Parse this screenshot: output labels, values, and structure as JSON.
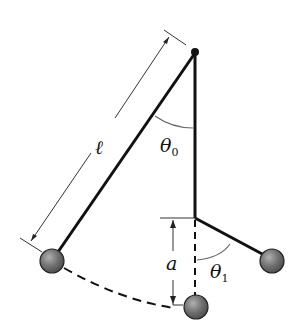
{
  "diagram": {
    "type": "pendulum-with-peg",
    "labels": {
      "length": "ℓ",
      "theta0_main": "θ",
      "theta0_sub": "0",
      "theta1_main": "θ",
      "theta1_sub": "1",
      "height": "a"
    },
    "colors": {
      "line": "#111111",
      "dimension": "#333333",
      "bob_fill": "#6e6e6e",
      "bob_highlight": "#a8a8a8",
      "arc": "#555555"
    },
    "elements": [
      "pivot point",
      "pendulum rod at angle theta0 of length l",
      "vertical rod to peg",
      "lower swing segment at angle theta1",
      "three bob positions",
      "dashed arc path",
      "dimension a from peg to lowest bob",
      "dimension l along rod"
    ]
  }
}
